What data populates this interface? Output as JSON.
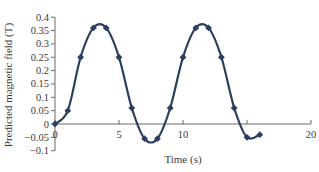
{
  "chart_data": {
    "type": "line",
    "title": "",
    "xlabel": "Time (s)",
    "ylabel": "Predicted magnetic field (T)",
    "xlim": [
      0,
      20
    ],
    "ylim": [
      -0.1,
      0.4
    ],
    "x_ticks": [
      0,
      5,
      10,
      20
    ],
    "x_tick_labels": [
      "0",
      "5",
      "10",
      "20"
    ],
    "y_ticks": [
      -0.1,
      -0.05,
      0,
      0.05,
      0.1,
      0.15,
      0.2,
      0.25,
      0.3,
      0.35,
      0.4
    ],
    "y_tick_labels": [
      "−0.1",
      "−0.05",
      "0",
      "0.05",
      "0.1",
      "0.15",
      "0.2",
      "0.25",
      "0.3",
      "0.35",
      "0.4"
    ],
    "grid": false,
    "legend": null,
    "series": [
      {
        "name": "Predicted magnetic field",
        "marker": "diamond",
        "smooth": true,
        "color": "#2b3f5e",
        "x": [
          0,
          1,
          2,
          3,
          4,
          5,
          6,
          7,
          8,
          9,
          10,
          11,
          12,
          13,
          14,
          15,
          16
        ],
        "values": [
          0,
          0.05,
          0.25,
          0.36,
          0.36,
          0.25,
          0.06,
          -0.055,
          -0.055,
          0.06,
          0.25,
          0.36,
          0.36,
          0.25,
          0.06,
          -0.05,
          -0.04
        ]
      }
    ]
  },
  "colors": {
    "line": "#2b3f5e",
    "axis": "#6a6a6a",
    "text": "#3a3a3a"
  }
}
